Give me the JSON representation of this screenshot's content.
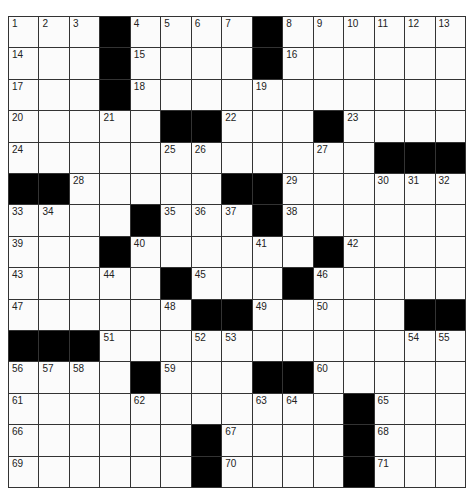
{
  "puzzle": {
    "rows": 15,
    "cols": 15,
    "colors": {
      "black": "#000000",
      "white": "#fbfbfb",
      "line": "#333333"
    },
    "layout": [
      "...#....#......",
      "...#....#......",
      "...#...........",
      ".....##...#....",
      "............###",
      "##.....##......",
      "....#...#......",
      "...#......#....",
      ".....#...#.....",
      "......##.....##",
      "###............",
      "....#...##.....",
      "...........#...",
      "......#....#...",
      "......#....#..."
    ],
    "numbers": [
      {
        "r": 0,
        "c": 0,
        "n": "1"
      },
      {
        "r": 0,
        "c": 1,
        "n": "2"
      },
      {
        "r": 0,
        "c": 2,
        "n": "3"
      },
      {
        "r": 0,
        "c": 4,
        "n": "4"
      },
      {
        "r": 0,
        "c": 5,
        "n": "5"
      },
      {
        "r": 0,
        "c": 6,
        "n": "6"
      },
      {
        "r": 0,
        "c": 7,
        "n": "7"
      },
      {
        "r": 0,
        "c": 9,
        "n": "8"
      },
      {
        "r": 0,
        "c": 10,
        "n": "9"
      },
      {
        "r": 0,
        "c": 11,
        "n": "10"
      },
      {
        "r": 0,
        "c": 12,
        "n": "11"
      },
      {
        "r": 0,
        "c": 13,
        "n": "12"
      },
      {
        "r": 0,
        "c": 14,
        "n": "13"
      },
      {
        "r": 1,
        "c": 0,
        "n": "14"
      },
      {
        "r": 1,
        "c": 4,
        "n": "15"
      },
      {
        "r": 1,
        "c": 9,
        "n": "16"
      },
      {
        "r": 2,
        "c": 0,
        "n": "17"
      },
      {
        "r": 2,
        "c": 4,
        "n": "18"
      },
      {
        "r": 2,
        "c": 8,
        "n": "19"
      },
      {
        "r": 3,
        "c": 0,
        "n": "20"
      },
      {
        "r": 3,
        "c": 3,
        "n": "21"
      },
      {
        "r": 3,
        "c": 7,
        "n": "22"
      },
      {
        "r": 3,
        "c": 11,
        "n": "23"
      },
      {
        "r": 4,
        "c": 0,
        "n": "24"
      },
      {
        "r": 4,
        "c": 5,
        "n": "25"
      },
      {
        "r": 4,
        "c": 6,
        "n": "26"
      },
      {
        "r": 4,
        "c": 10,
        "n": "27"
      },
      {
        "r": 5,
        "c": 2,
        "n": "28"
      },
      {
        "r": 5,
        "c": 9,
        "n": "29"
      },
      {
        "r": 5,
        "c": 12,
        "n": "30"
      },
      {
        "r": 5,
        "c": 13,
        "n": "31"
      },
      {
        "r": 5,
        "c": 14,
        "n": "32"
      },
      {
        "r": 6,
        "c": 0,
        "n": "33"
      },
      {
        "r": 6,
        "c": 1,
        "n": "34"
      },
      {
        "r": 6,
        "c": 5,
        "n": "35"
      },
      {
        "r": 6,
        "c": 6,
        "n": "36"
      },
      {
        "r": 6,
        "c": 7,
        "n": "37"
      },
      {
        "r": 6,
        "c": 9,
        "n": "38"
      },
      {
        "r": 7,
        "c": 0,
        "n": "39"
      },
      {
        "r": 7,
        "c": 4,
        "n": "40"
      },
      {
        "r": 7,
        "c": 8,
        "n": "41"
      },
      {
        "r": 7,
        "c": 11,
        "n": "42"
      },
      {
        "r": 8,
        "c": 0,
        "n": "43"
      },
      {
        "r": 8,
        "c": 3,
        "n": "44"
      },
      {
        "r": 8,
        "c": 6,
        "n": "45"
      },
      {
        "r": 8,
        "c": 10,
        "n": "46"
      },
      {
        "r": 9,
        "c": 0,
        "n": "47"
      },
      {
        "r": 9,
        "c": 5,
        "n": "48"
      },
      {
        "r": 9,
        "c": 8,
        "n": "49"
      },
      {
        "r": 9,
        "c": 10,
        "n": "50"
      },
      {
        "r": 10,
        "c": 3,
        "n": "51"
      },
      {
        "r": 10,
        "c": 6,
        "n": "52"
      },
      {
        "r": 10,
        "c": 7,
        "n": "53"
      },
      {
        "r": 10,
        "c": 13,
        "n": "54"
      },
      {
        "r": 10,
        "c": 14,
        "n": "55"
      },
      {
        "r": 11,
        "c": 0,
        "n": "56"
      },
      {
        "r": 11,
        "c": 1,
        "n": "57"
      },
      {
        "r": 11,
        "c": 2,
        "n": "58"
      },
      {
        "r": 11,
        "c": 5,
        "n": "59"
      },
      {
        "r": 11,
        "c": 10,
        "n": "60"
      },
      {
        "r": 12,
        "c": 0,
        "n": "61"
      },
      {
        "r": 12,
        "c": 4,
        "n": "62"
      },
      {
        "r": 12,
        "c": 8,
        "n": "63"
      },
      {
        "r": 12,
        "c": 9,
        "n": "64"
      },
      {
        "r": 12,
        "c": 12,
        "n": "65"
      },
      {
        "r": 13,
        "c": 0,
        "n": "66"
      },
      {
        "r": 13,
        "c": 7,
        "n": "67"
      },
      {
        "r": 13,
        "c": 12,
        "n": "68"
      },
      {
        "r": 14,
        "c": 0,
        "n": "69"
      },
      {
        "r": 14,
        "c": 7,
        "n": "70"
      },
      {
        "r": 14,
        "c": 12,
        "n": "71"
      }
    ]
  }
}
